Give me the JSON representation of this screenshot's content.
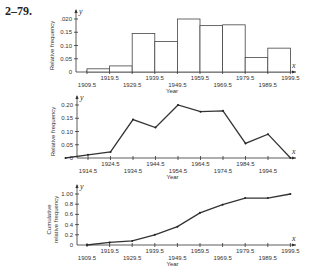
{
  "title": "2–79.",
  "chart_data": [
    {
      "type": "bar",
      "title": "Histogram",
      "xlabel": "Year",
      "ylabel": "Relative frequency",
      "axis_letters": {
        "x": "x",
        "y": "y"
      },
      "bin_edges": [
        1909.5,
        1919.5,
        1929.5,
        1939.5,
        1949.5,
        1959.5,
        1969.5,
        1979.5,
        1989.5,
        1999.5
      ],
      "values": [
        0.012,
        0.023,
        0.145,
        0.115,
        0.2,
        0.175,
        0.178,
        0.055,
        0.09
      ],
      "yticks": [
        0,
        0.05,
        0.1,
        0.15,
        0.2
      ],
      "ytick_labels": [
        "0",
        "0.05",
        "0.10",
        "0.15",
        ".020"
      ],
      "xtick_labels": [
        "1909.5",
        "1919.5",
        "1929.5",
        "1939.5",
        "1949.5",
        "1959.5",
        "1969.5",
        "1979.5",
        "1989.5",
        "1999.5"
      ],
      "ylim": [
        0,
        0.2
      ]
    },
    {
      "type": "line",
      "title": "Frequency polygon",
      "xlabel": "Year",
      "ylabel": "Relative frequency",
      "axis_letters": {
        "x": "x",
        "y": "y"
      },
      "x": [
        1904.5,
        1914.5,
        1924.5,
        1934.5,
        1944.5,
        1954.5,
        1964.5,
        1974.5,
        1984.5,
        1994.5,
        2004.5
      ],
      "values": [
        0,
        0.012,
        0.023,
        0.145,
        0.115,
        0.2,
        0.175,
        0.178,
        0.055,
        0.09,
        0
      ],
      "yticks": [
        0,
        0.05,
        0.1,
        0.15,
        0.2
      ],
      "ytick_labels": [
        "0",
        "0.05",
        "0.10",
        "0.15",
        "0.20"
      ],
      "xtick_labels": [
        "1914.5",
        "1924.5",
        "1934.5",
        "1944.5",
        "1954.5",
        "1964.5",
        "1974.5",
        "1984.5",
        "1994.5"
      ],
      "ylim": [
        0,
        0.2
      ]
    },
    {
      "type": "line",
      "title": "Ogive",
      "xlabel": "Year",
      "ylabel": "Cumulative relative frequency",
      "axis_letters": {
        "x": "x",
        "y": "y"
      },
      "x": [
        1909.5,
        1919.5,
        1929.5,
        1939.5,
        1949.5,
        1959.5,
        1969.5,
        1979.5,
        1989.5,
        1999.5
      ],
      "values": [
        0,
        0.05,
        0.08,
        0.2,
        0.36,
        0.63,
        0.79,
        0.92,
        0.92,
        1.0
      ],
      "yticks": [
        0,
        0.2,
        0.4,
        0.6,
        0.8,
        1.0
      ],
      "ytick_labels": [
        "0",
        "0.2",
        "0.4",
        "0.6",
        "0.8",
        "1.00"
      ],
      "xtick_labels": [
        "1909.5",
        "1919.5",
        "1929.5",
        "1939.5",
        "1949.5",
        "1959.5",
        "1969.5",
        "1979.5",
        "1989.5",
        "1999.5"
      ],
      "ylim": [
        0,
        1.0
      ]
    }
  ]
}
